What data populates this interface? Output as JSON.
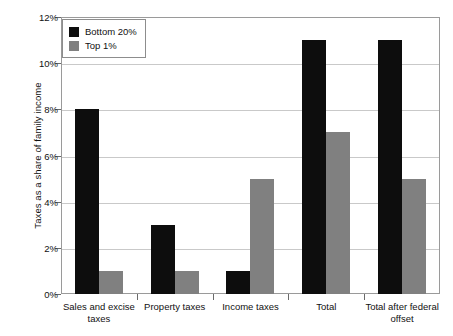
{
  "chart_data": {
    "type": "bar",
    "title": "",
    "xlabel": "",
    "ylabel": "Taxes as a share of family income",
    "categories": [
      "Sales and excise taxes",
      "Property taxes",
      "Income taxes",
      "Total",
      "Total after federal offset"
    ],
    "series": [
      {
        "name": "Bottom 20%",
        "color": "#0d0d0d",
        "values": [
          8,
          3,
          1,
          11,
          11
        ]
      },
      {
        "name": "Top 1%",
        "color": "#808080",
        "values": [
          1,
          1,
          5,
          7,
          5
        ]
      }
    ],
    "ylim": [
      0,
      12
    ],
    "ytick_values": [
      0,
      2,
      4,
      6,
      8,
      10,
      12
    ],
    "ytick_labels": [
      "0%",
      "2%",
      "4%",
      "6%",
      "8%",
      "10%",
      "12%"
    ],
    "grid": true,
    "legend_position": "top-left",
    "value_suffix": "%"
  }
}
